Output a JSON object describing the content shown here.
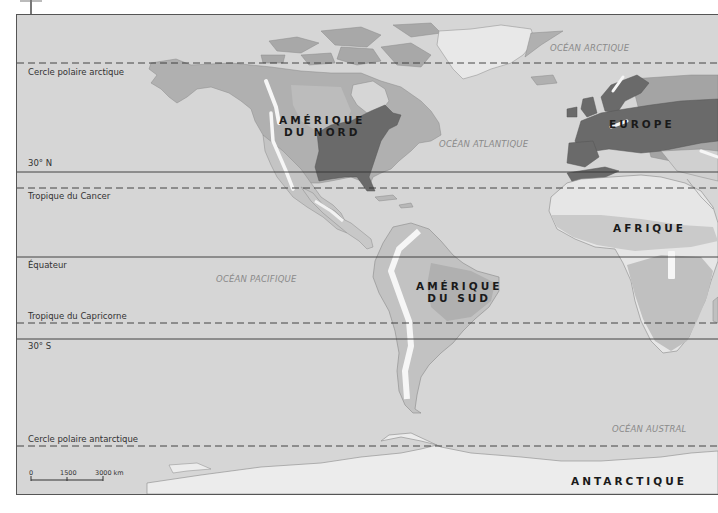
{
  "map": {
    "colors": {
      "ocean": "#d6d6d6",
      "land_light": "#e6e6e6",
      "land_mid": "#b4b4b4",
      "land_mid2": "#a6a6a6",
      "land_dark": "#6a6a6a",
      "mountain": "#f6f6f6",
      "lines": "#333333"
    },
    "latitude_lines": [
      {
        "label": "Cercle polaire arctique",
        "style": "dashed"
      },
      {
        "label": "30° N",
        "style": "solid"
      },
      {
        "label": "Tropique du Cancer",
        "style": "dashed"
      },
      {
        "label": "Équateur",
        "style": "solid"
      },
      {
        "label": "Tropique du Capricorne",
        "style": "dashed"
      },
      {
        "label": "30° S",
        "style": "solid"
      },
      {
        "label": "Cercle polaire antarctique",
        "style": "dashed"
      }
    ],
    "oceans": [
      {
        "label": "OCÉAN ARCTIQUE"
      },
      {
        "label": "OCÉAN ATLANTIQUE"
      },
      {
        "label": "OCÉAN PACIFIQUE"
      },
      {
        "label": "OCÉAN AUSTRAL"
      }
    ],
    "continents": {
      "north_america": {
        "line1": "AMÉRIQUE",
        "line2": "DU NORD"
      },
      "south_america": {
        "line1": "AMÉRIQUE",
        "line2": "DU SUD"
      },
      "europe": "EUROPE",
      "africa": "AFRIQUE",
      "antarctica": "ANTARCTIQUE"
    },
    "scale_bar": {
      "ticks": [
        "0",
        "1500",
        "3000 km"
      ]
    }
  }
}
